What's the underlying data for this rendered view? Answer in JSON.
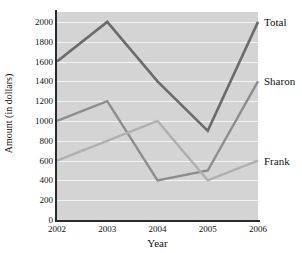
{
  "top_sliver_text": "",
  "chart_data": {
    "type": "line",
    "title": "",
    "xlabel": "Year",
    "ylabel": "Amount (in dollars)",
    "categories": [
      "2002",
      "2003",
      "2004",
      "2005",
      "2006"
    ],
    "x": [
      2002,
      2003,
      2004,
      2005,
      2006
    ],
    "xlim": [
      2002,
      2006
    ],
    "ylim": [
      0,
      2100
    ],
    "yticks": [
      0,
      200,
      400,
      600,
      800,
      1000,
      1200,
      1400,
      1600,
      1800,
      2000
    ],
    "ytick_labels": [
      "0",
      "200",
      "400",
      "600",
      "800",
      "1000",
      "1200",
      "1400",
      "1600",
      "1800",
      "2000"
    ],
    "grid": true,
    "grid_orientation": "horizontal",
    "grid_color": "#f4f4f4",
    "plot_background": "#d4d4d4",
    "legend_position": "right-inline-end-labels",
    "series": [
      {
        "name": "Total",
        "label": "Total",
        "color": "#6b6b6b",
        "width": 2.6,
        "values": [
          1600,
          2000,
          1400,
          900,
          2000
        ]
      },
      {
        "name": "Sharon",
        "label": "Sharon",
        "color": "#8d8d8d",
        "width": 2.4,
        "values": [
          1000,
          1200,
          400,
          500,
          1400
        ]
      },
      {
        "name": "Frank",
        "label": "Frank",
        "color": "#b0b0b0",
        "width": 2.4,
        "values": [
          600,
          800,
          1000,
          400,
          600
        ]
      }
    ]
  }
}
